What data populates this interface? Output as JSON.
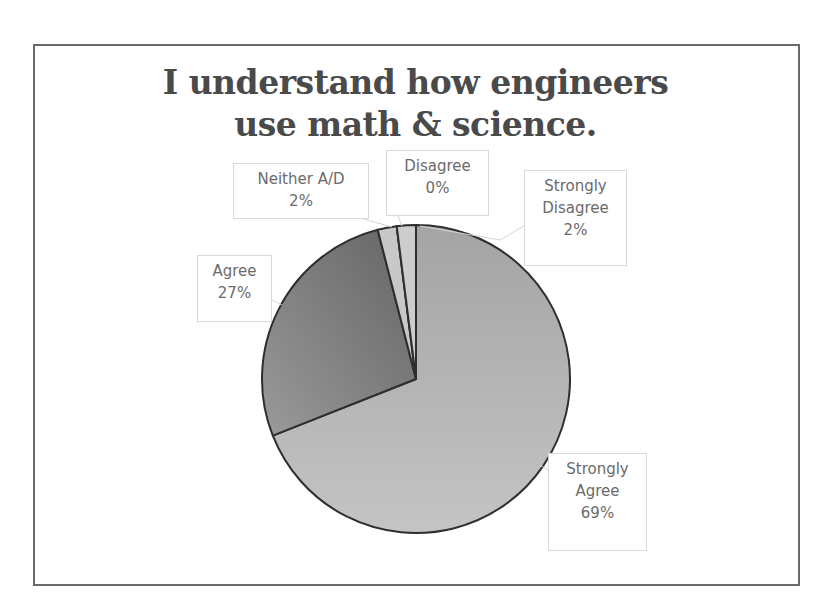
{
  "chart_data": {
    "type": "pie",
    "title": "I understand how engineers use math & science.",
    "title_lines": [
      "I understand how engineers",
      "use math & science."
    ],
    "categories": [
      "Strongly Agree",
      "Agree",
      "Neither A/D",
      "Disagree",
      "Strongly Disagree"
    ],
    "values": [
      69,
      27,
      2,
      0,
      2
    ],
    "unit": "%",
    "start_angle": "12 o'clock, clockwise",
    "legend": "none (data labels with callouts)",
    "labels": [
      {
        "category_lines": [
          "Strongly",
          "Agree"
        ],
        "value": "69%"
      },
      {
        "category_lines": [
          "Agree"
        ],
        "value": "27%"
      },
      {
        "category_lines": [
          "Neither A/D"
        ],
        "value": "2%"
      },
      {
        "category_lines": [
          "Disagree"
        ],
        "value": "0%"
      },
      {
        "category_lines": [
          "Strongly",
          "Disagree"
        ],
        "value": "2%"
      }
    ],
    "colors": [
      "#b4b4b4",
      "#7a7a7a",
      "#c8c8c8",
      "#d0d0d0",
      "#cdcdcd"
    ]
  }
}
